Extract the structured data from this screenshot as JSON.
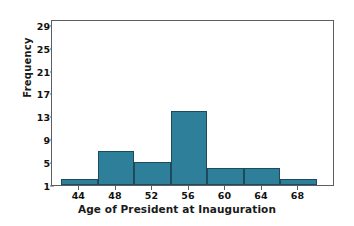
{
  "chart_data": {
    "type": "bar",
    "title": "",
    "xlabel": "Age of President at Inauguration",
    "ylabel": "Frequency",
    "xtick_labels": [
      "44",
      "48",
      "52",
      "56",
      "60",
      "64",
      "68"
    ],
    "xtick_values": [
      44,
      48,
      52,
      56,
      60,
      64,
      68
    ],
    "ytick_labels": [
      "1",
      "5",
      "9",
      "13",
      "17",
      "21",
      "25",
      "29"
    ],
    "ytick_values": [
      1,
      5,
      9,
      13,
      17,
      21,
      25,
      29
    ],
    "xlim": [
      41,
      72
    ],
    "ylim": [
      1,
      30
    ],
    "grid": false,
    "legend": null,
    "bin_width": 4,
    "bin_edges": [
      42,
      46,
      50,
      54,
      58,
      62,
      66,
      70
    ],
    "categories": [
      "42-46",
      "46-50",
      "50-54",
      "54-58",
      "58-62",
      "62-66",
      "66-70"
    ],
    "values": [
      2,
      7,
      5,
      14,
      4,
      4,
      2
    ],
    "bar_color": "#2e7f99",
    "bar_edge_color": "#1d4b5c",
    "axis_color": "#5a5f63",
    "background_color": "#ffffff"
  }
}
